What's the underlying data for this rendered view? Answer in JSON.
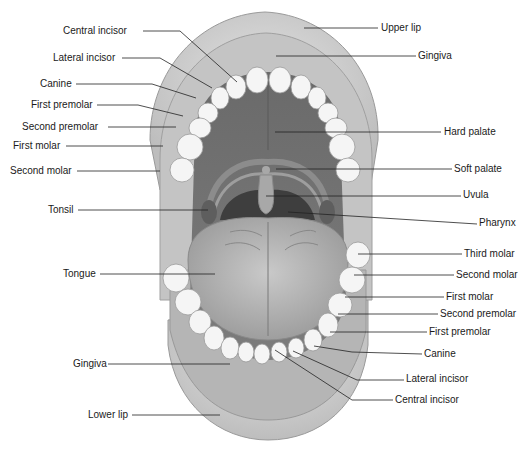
{
  "diagram": {
    "colors": {
      "lip": "#cfcfcf",
      "gingiva": "#b9b9b9",
      "cavity": "#6e6e6e",
      "palate": "#7a7a7a",
      "tongue": "#b3b3b3",
      "teeth": "#f4f4f4",
      "pharynx": "#3c3c3c",
      "leader_line": "#222222",
      "text": "#1a1a1a"
    },
    "labels_left": [
      {
        "text": "Central incisor",
        "x": 63,
        "y": 26
      },
      {
        "text": "Lateral incisor",
        "x": 53,
        "y": 53
      },
      {
        "text": "Canine",
        "x": 40,
        "y": 79
      },
      {
        "text": "First premolar",
        "x": 31,
        "y": 100
      },
      {
        "text": "Second premolar",
        "x": 22,
        "y": 121
      },
      {
        "text": "First molar",
        "x": 13,
        "y": 141
      },
      {
        "text": "Second molar",
        "x": 10,
        "y": 166
      },
      {
        "text": "Tonsil",
        "x": 48,
        "y": 204
      },
      {
        "text": "Tongue",
        "x": 63,
        "y": 269
      },
      {
        "text": "Gingiva",
        "x": 73,
        "y": 359
      },
      {
        "text": "Lower lip",
        "x": 88,
        "y": 409
      }
    ],
    "labels_right": [
      {
        "text": "Upper lip",
        "x": 381,
        "y": 22
      },
      {
        "text": "Gingiva",
        "x": 418,
        "y": 51
      },
      {
        "text": "Hard palate",
        "x": 444,
        "y": 126
      },
      {
        "text": "Soft palate",
        "x": 454,
        "y": 164
      },
      {
        "text": "Uvula",
        "x": 463,
        "y": 189
      },
      {
        "text": "Pharynx",
        "x": 479,
        "y": 219
      },
      {
        "text": "Third molar",
        "x": 464,
        "y": 249
      },
      {
        "text": "Second molar",
        "x": 456,
        "y": 270
      },
      {
        "text": "First molar",
        "x": 446,
        "y": 292
      },
      {
        "text": "Second premolar",
        "x": 440,
        "y": 309
      },
      {
        "text": "First premolar",
        "x": 429,
        "y": 326
      },
      {
        "text": "Canine",
        "x": 424,
        "y": 348
      },
      {
        "text": "Lateral incisor",
        "x": 406,
        "y": 373
      },
      {
        "text": "Central incisor",
        "x": 395,
        "y": 395
      }
    ]
  }
}
